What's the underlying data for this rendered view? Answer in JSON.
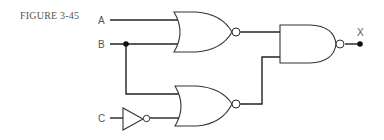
{
  "figure": {
    "label": "FIGURE 3-45"
  },
  "circuit": {
    "inputs": [
      {
        "name": "A"
      },
      {
        "name": "B"
      },
      {
        "name": "C"
      }
    ],
    "output": {
      "name": "X"
    },
    "gates": [
      {
        "id": "nor1",
        "type": "NOR",
        "inputs": [
          "A",
          "B"
        ]
      },
      {
        "id": "inv1",
        "type": "NOT",
        "inputs": [
          "C"
        ]
      },
      {
        "id": "nor2",
        "type": "NOR",
        "inputs": [
          "B",
          "inv1"
        ]
      },
      {
        "id": "nand1",
        "type": "NAND",
        "inputs": [
          "nor1",
          "nor2"
        ],
        "output": "X"
      }
    ]
  }
}
